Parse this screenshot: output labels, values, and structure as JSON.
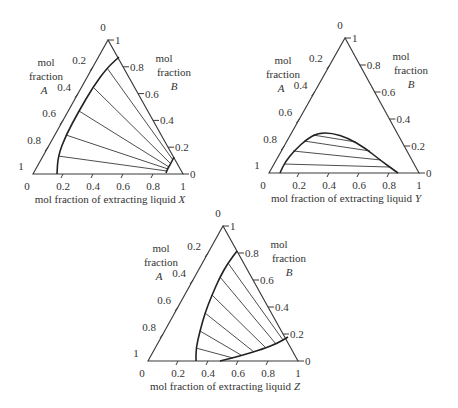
{
  "colors": {
    "line": "#3a3a3a",
    "curve": "#222222",
    "text": "#333333",
    "background": "#ffffff"
  },
  "common": {
    "left_axis_label": [
      "mol",
      "fraction",
      "A"
    ],
    "right_axis_label": [
      "mol",
      "fraction",
      "B"
    ],
    "left_ticks": [
      "0",
      "0.2",
      "0.4",
      "0.6",
      "0.8",
      "1"
    ],
    "right_ticks": [
      "1",
      "0.8",
      "0.6",
      "0.4",
      "0.2",
      "0"
    ],
    "bottom_ticks": [
      "0",
      "0.2",
      "0.4",
      "0.6",
      "0.8",
      "1"
    ]
  },
  "diagrams": [
    {
      "id": "X",
      "xlabel_prefix": "mol fraction of extracting liquid",
      "xlabel_var": "X",
      "triangle": {
        "bl": [
          33,
          174
        ],
        "br": [
          183,
          174
        ],
        "top": [
          108,
          40
        ]
      },
      "curves": [
        [
          [
            57,
            174
          ],
          [
            58,
            156
          ],
          [
            66,
            135
          ],
          [
            79,
            111
          ],
          [
            93,
            87
          ],
          [
            107,
            68
          ],
          [
            119,
            57
          ]
        ],
        [
          [
            166,
            173
          ],
          [
            168,
            168
          ],
          [
            170,
            165
          ],
          [
            172,
            161
          ],
          [
            174,
            157
          ]
        ]
      ],
      "tie_lines": [
        [
          [
            58,
            156
          ],
          [
            167,
            171
          ]
        ],
        [
          [
            66,
            135
          ],
          [
            168,
            169
          ]
        ],
        [
          [
            79,
            111
          ],
          [
            169,
            167
          ]
        ],
        [
          [
            93,
            87
          ],
          [
            171,
            164
          ]
        ],
        [
          [
            107,
            68
          ],
          [
            173,
            160
          ]
        ]
      ]
    },
    {
      "id": "Y",
      "xlabel_prefix": "mol fraction of extracting liquid",
      "xlabel_var": "Y",
      "triangle": {
        "bl": [
          269,
          173
        ],
        "br": [
          419,
          173
        ],
        "top": [
          345,
          38
        ]
      },
      "curves": [
        [
          [
            280,
            173
          ],
          [
            285,
            162
          ],
          [
            295,
            150
          ],
          [
            307,
            139
          ],
          [
            318,
            133
          ],
          [
            332,
            133
          ],
          [
            348,
            138
          ],
          [
            365,
            148
          ],
          [
            380,
            160
          ],
          [
            398,
            173
          ]
        ]
      ],
      "tie_lines": [
        [
          [
            284,
            164
          ],
          [
            389,
            167
          ]
        ],
        [
          [
            293,
            151
          ],
          [
            381,
            160
          ]
        ],
        [
          [
            304,
            141
          ],
          [
            370,
            151
          ]
        ],
        [
          [
            313,
            135
          ],
          [
            356,
            142
          ]
        ]
      ]
    },
    {
      "id": "Z",
      "xlabel_prefix": "mol fraction of extracting liquid",
      "xlabel_var": "Z",
      "triangle": {
        "bl": [
          148,
          361
        ],
        "br": [
          298,
          361
        ],
        "top": [
          223,
          226
        ]
      },
      "curves": [
        [
          [
            196,
            361
          ],
          [
            196,
            348
          ],
          [
            200,
            331
          ],
          [
            205,
            313
          ],
          [
            212,
            295
          ],
          [
            220,
            277
          ],
          [
            228,
            263
          ],
          [
            237,
            251
          ]
        ],
        [
          [
            220,
            361
          ],
          [
            240,
            356
          ],
          [
            263,
            349
          ],
          [
            278,
            343
          ],
          [
            288,
            337
          ]
        ]
      ],
      "tie_lines": [
        [
          [
            196,
            348
          ],
          [
            233,
            358
          ]
        ],
        [
          [
            200,
            331
          ],
          [
            241,
            355
          ]
        ],
        [
          [
            205,
            313
          ],
          [
            254,
            352
          ]
        ],
        [
          [
            212,
            295
          ],
          [
            266,
            348
          ]
        ],
        [
          [
            220,
            277
          ],
          [
            276,
            344
          ]
        ],
        [
          [
            228,
            263
          ],
          [
            283,
            340
          ]
        ]
      ]
    }
  ]
}
